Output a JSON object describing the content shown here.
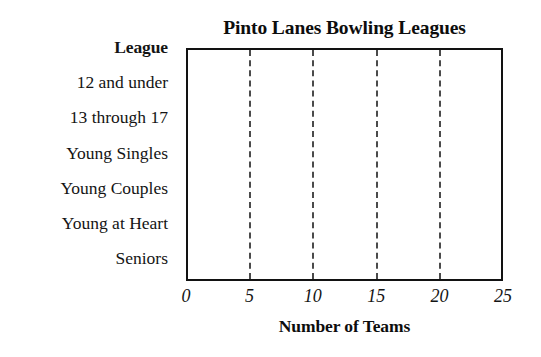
{
  "chart_data": {
    "type": "bar",
    "title": "Pinto Lanes Bowling Leagues",
    "orientation": "horizontal",
    "xlabel": "Number of Teams",
    "ylabel": "League",
    "categories": [
      "12 and under",
      "13 through  17",
      "Young Singles",
      "Young Couples",
      "Young at Heart",
      "Seniors"
    ],
    "values": [
      null,
      null,
      null,
      null,
      null,
      null
    ],
    "xlim": [
      0,
      25
    ],
    "xticks": [
      0,
      5,
      10,
      15,
      20,
      25
    ],
    "xticklabels": [
      "0",
      "5",
      "10",
      "15",
      "20",
      "25"
    ],
    "gridlines_at": [
      5,
      10,
      15,
      20
    ],
    "grid": true,
    "grid_style": "dashed",
    "legend": null,
    "note": "Blank chart template — no bars are plotted",
    "colors": {
      "axis": "#121212",
      "grid": "#4a4a4a",
      "text": "#141414",
      "background": "#ffffff"
    }
  },
  "axis": {
    "category_header": "League"
  }
}
